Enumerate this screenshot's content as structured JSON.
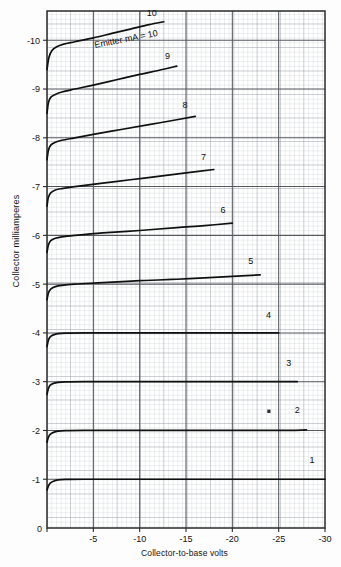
{
  "chart_data": {
    "type": "line",
    "title": "",
    "xlabel": "Collector-to-base volts",
    "ylabel": "Collector milliamperes",
    "xlim": [
      0,
      -30
    ],
    "ylim": [
      0,
      -10.6
    ],
    "xticks": [
      0,
      -5,
      -10,
      -15,
      -20,
      -25,
      -30
    ],
    "xtick_labels": [
      "0",
      "-5",
      "-10",
      "-15",
      "-20",
      "-25",
      "-30"
    ],
    "yticks": [
      0,
      -1,
      -2,
      -3,
      -4,
      -5,
      -6,
      -7,
      -8,
      -9,
      -10
    ],
    "ytick_labels": [
      "0",
      "-1",
      "-2",
      "-3",
      "-4",
      "-5",
      "-6",
      "-7",
      "-8",
      "-9",
      "-10"
    ],
    "grid": true,
    "grid_minor": true,
    "annotation": "Emitter mA = 10",
    "series": [
      {
        "name": "1",
        "label": "1",
        "emitter_mA": 1,
        "x": [
          0,
          -0.15,
          -0.35,
          -0.7,
          -1.2,
          -2,
          -4,
          -8,
          -14,
          -20,
          -26,
          -30
        ],
        "y": [
          -0.78,
          -0.86,
          -0.92,
          -0.96,
          -0.985,
          -0.995,
          -1.0,
          -1.0,
          -1.0,
          -1.0,
          -1.0,
          -1.0
        ],
        "label_x": -28.6,
        "label_y": -1.33
      },
      {
        "name": "2",
        "label": "2",
        "emitter_mA": 2,
        "x": [
          0,
          -0.15,
          -0.35,
          -0.7,
          -1.2,
          -2,
          -4,
          -8,
          -14,
          -20,
          -25,
          -28
        ],
        "y": [
          -1.76,
          -1.86,
          -1.92,
          -1.96,
          -1.985,
          -1.995,
          -2.0,
          -2.0,
          -2.0,
          -2.0,
          -2.0,
          -2.01
        ],
        "label_x": -27.0,
        "label_y": -2.35
      },
      {
        "name": "3",
        "label": "3",
        "emitter_mA": 3,
        "x": [
          0,
          -0.15,
          -0.35,
          -0.7,
          -1.2,
          -2,
          -4,
          -8,
          -14,
          -20,
          -25,
          -27
        ],
        "y": [
          -2.74,
          -2.86,
          -2.93,
          -2.965,
          -2.985,
          -2.995,
          -3.0,
          -3.0,
          -3.0,
          -3.0,
          -3.0,
          -3.0
        ],
        "label_x": -26.1,
        "label_y": -3.33
      },
      {
        "name": "4",
        "label": "4",
        "emitter_mA": 4,
        "x": [
          0,
          -0.15,
          -0.35,
          -0.7,
          -1.2,
          -2,
          -4,
          -8,
          -14,
          -20,
          -25
        ],
        "y": [
          -3.72,
          -3.85,
          -3.92,
          -3.96,
          -3.985,
          -3.995,
          -4.0,
          -4.0,
          -4.0,
          -4.0,
          -4.0
        ],
        "label_x": -23.9,
        "label_y": -4.3
      },
      {
        "name": "5",
        "label": "5",
        "emitter_mA": 5,
        "x": [
          0,
          -0.15,
          -0.4,
          -0.9,
          -1.6,
          -3,
          -6,
          -10,
          -14,
          -18,
          -21,
          -23
        ],
        "y": [
          -4.68,
          -4.82,
          -4.9,
          -4.95,
          -4.975,
          -5.0,
          -5.03,
          -5.07,
          -5.1,
          -5.14,
          -5.17,
          -5.19
        ],
        "label_x": -22.0,
        "label_y": -5.42
      },
      {
        "name": "6",
        "label": "6",
        "emitter_mA": 6,
        "x": [
          0,
          -0.15,
          -0.4,
          -0.9,
          -1.6,
          -3,
          -6,
          -10,
          -14,
          -17,
          -20
        ],
        "y": [
          -5.65,
          -5.8,
          -5.89,
          -5.94,
          -5.97,
          -6.0,
          -6.05,
          -6.1,
          -6.16,
          -6.2,
          -6.25
        ],
        "label_x": -19.0,
        "label_y": -6.45
      },
      {
        "name": "7",
        "label": "7",
        "emitter_mA": 7,
        "x": [
          0,
          -0.15,
          -0.4,
          -0.9,
          -1.6,
          -3,
          -6,
          -9,
          -12,
          -15,
          -18
        ],
        "y": [
          -6.6,
          -6.78,
          -6.87,
          -6.93,
          -6.96,
          -7.0,
          -7.07,
          -7.14,
          -7.21,
          -7.28,
          -7.35
        ],
        "label_x": -16.9,
        "label_y": -7.55
      },
      {
        "name": "8",
        "label": "8",
        "emitter_mA": 8,
        "x": [
          0,
          -0.15,
          -0.4,
          -0.9,
          -1.6,
          -3,
          -5,
          -8,
          -11,
          -14,
          -16
        ],
        "y": [
          -7.55,
          -7.74,
          -7.85,
          -7.91,
          -7.95,
          -8.0,
          -8.07,
          -8.17,
          -8.27,
          -8.37,
          -8.44
        ],
        "label_x": -14.9,
        "label_y": -8.62
      },
      {
        "name": "9",
        "label": "9",
        "emitter_mA": 9,
        "x": [
          0,
          -0.15,
          -0.4,
          -0.9,
          -1.6,
          -3,
          -5,
          -7.5,
          -10,
          -12,
          -14
        ],
        "y": [
          -8.5,
          -8.72,
          -8.83,
          -8.89,
          -8.94,
          -9.0,
          -9.08,
          -9.19,
          -9.3,
          -9.38,
          -9.47
        ],
        "label_x": -13.0,
        "label_y": -9.62
      },
      {
        "name": "10",
        "label": "10",
        "emitter_mA": 10,
        "x": [
          0,
          -0.2,
          -0.5,
          -1.0,
          -1.8,
          -3,
          -5,
          -7,
          -9,
          -11,
          -12.6
        ],
        "y": [
          -9.4,
          -9.64,
          -9.78,
          -9.86,
          -9.92,
          -9.97,
          -10.05,
          -10.14,
          -10.23,
          -10.32,
          -10.38
        ],
        "label_x": -11.3,
        "label_y": -10.5
      }
    ]
  },
  "axis": {
    "x_title": "Collector-to-base volts",
    "y_title": "Collector milliamperes",
    "origin_label": "0"
  },
  "annotations": {
    "emitter_note": "Emitter mA = 10"
  }
}
